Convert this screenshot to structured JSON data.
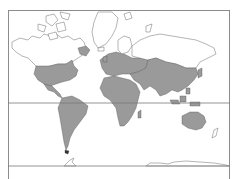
{
  "figure": {
    "type": "world-map",
    "projection": "Mercator",
    "colors": {
      "shaded_fill": "#9a9a9a",
      "unshaded_fill": "#ffffff",
      "coastline": "#6a6a6a",
      "frame": "#8c8c8c",
      "background": "#ffffff"
    },
    "reference_lines": [
      {
        "name": "equator",
        "y": 103
      },
      {
        "name": "southern-parallel",
        "y": 166
      }
    ],
    "shaded_regions": [
      "Central and Eastern United States",
      "Mexico and Central America",
      "South America",
      "Southern tip of Greenland",
      "Europe",
      "Africa",
      "Middle East",
      "Central and South Asia",
      "China and East Asia",
      "Southeast Asia and Indonesia",
      "Japan",
      "Australia"
    ],
    "unshaded_regions": [
      "Alaska",
      "Canada",
      "Arctic Archipelago",
      "Greenland",
      "Northern Russia / Siberia",
      "New Zealand",
      "Antarctica"
    ]
  }
}
